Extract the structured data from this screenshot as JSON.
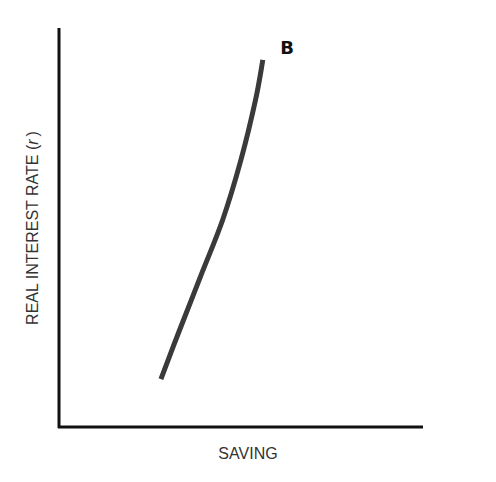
{
  "chart_data": {
    "type": "line",
    "title": "",
    "panel_label": "B",
    "xlabel": "SAVING",
    "ylabel": "REAL INTEREST RATE (r)",
    "ylabel_main": "REAL INTEREST RATE (",
    "ylabel_var": "r",
    "ylabel_close": ")",
    "xlim": [
      0,
      1
    ],
    "ylim": [
      0,
      1
    ],
    "grid": false,
    "ticks": false,
    "series": [
      {
        "name": "saving-curve",
        "x": [
          0.28,
          0.33,
          0.39,
          0.45,
          0.5,
          0.54,
          0.56
        ],
        "y": [
          0.12,
          0.24,
          0.38,
          0.52,
          0.67,
          0.82,
          0.92
        ]
      }
    ]
  }
}
